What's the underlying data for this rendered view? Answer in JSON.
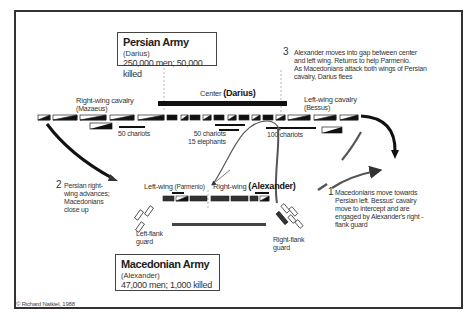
{
  "persian_army": {
    "title": "Persian Army",
    "commander": "(Darius)",
    "stats": "250,000 men; 50,000 killed"
  },
  "macedonian_army": {
    "title": "Macedonian Army",
    "commander": "(Alexander)",
    "stats": "47,000 men; 1,000 killed"
  },
  "persian_units": {
    "right_wing": "Right-wing cavalry",
    "right_wing_cmdr": "(Mazaeus)",
    "center": "Center",
    "center_cmdr": "(Darius)",
    "left_wing": "Left-wing cavalry",
    "left_wing_cmdr": "(Bessus)",
    "chariots_a": "50 chariots",
    "chariots_b": "50 chariots",
    "elephants": "15 elephants",
    "chariots_c": "100 chariots"
  },
  "macedonian_units": {
    "left_wing": "Left-wing",
    "left_wing_cmdr": "(Parmenio)",
    "right_wing": "Right-wing",
    "right_wing_cmdr": "(Alexander)",
    "left_flank": [
      "Left-flank",
      "guard"
    ],
    "right_flank": [
      "Right-flank",
      "guard"
    ]
  },
  "annotations": [
    {
      "num": "1",
      "lines": [
        "Macedonians move towards",
        "Persian left. Bessus' cavalry",
        "move to intercept and are",
        "engaged by Alexander's right -",
        "flank guard"
      ]
    },
    {
      "num": "2",
      "lines": [
        "Persian right-",
        "wing advances;",
        "Macedonians",
        "close up"
      ]
    },
    {
      "num": "3",
      "lines": [
        "Alexander moves into gap between center",
        "and left wing. Returns to help Parmenio.",
        "As Macedonians attack both wings of Persian",
        "cavalry, Darius flees"
      ]
    }
  ],
  "credit": "© Richard Natkiel, 1988"
}
